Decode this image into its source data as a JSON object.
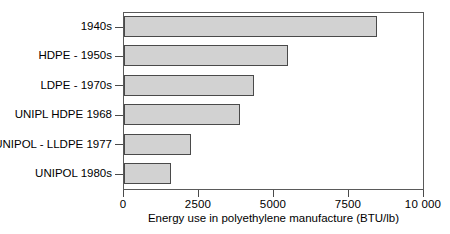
{
  "chart_data": {
    "type": "bar",
    "orientation": "horizontal",
    "title": "",
    "xlabel": "Energy use in polyethylene manufacture (BTU/lb)",
    "ylabel": "",
    "xlim": [
      0,
      10000
    ],
    "grid": false,
    "legend": null,
    "xticks": [
      0,
      2500,
      5000,
      7500,
      10000
    ],
    "xtick_labels": [
      "0",
      "2500",
      "5000",
      "7500",
      "10 000"
    ],
    "categories": [
      "1940s",
      "HDPE - 1950s",
      "LDPE - 1970s",
      "UNIPL HDPE 1968",
      "UNIPOL - LLDPE 1977",
      "UNIPOL 1980s"
    ],
    "values": [
      8440,
      5480,
      4320,
      3850,
      2220,
      1560
    ],
    "bar_fill_color": "#d2d2d2",
    "bar_edge_color": "#4a4a4a",
    "axis_color": "#5a5a5a"
  }
}
